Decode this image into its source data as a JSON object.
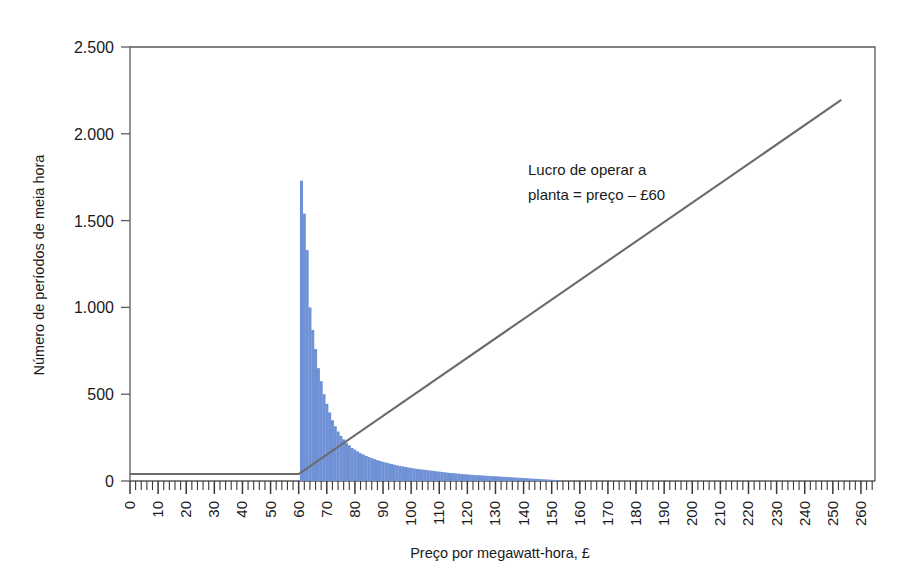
{
  "chart_data": {
    "type": "bar",
    "title": "",
    "subtitle": "",
    "xlabel": "Preço por megawatt-hora, £",
    "ylabel": "Número de períodos de meia hora",
    "xlim": [
      0,
      265
    ],
    "ylim": [
      0,
      2500
    ],
    "grid": false,
    "legend_position": "none",
    "y_ticks": [
      0,
      500,
      1000,
      1500,
      2000,
      2500
    ],
    "y_tick_labels": [
      "0",
      "500",
      "1.000",
      "1.500",
      "2.000",
      "2.500"
    ],
    "x_ticks": [
      0,
      10,
      20,
      30,
      40,
      50,
      60,
      70,
      80,
      90,
      100,
      110,
      120,
      130,
      140,
      150,
      160,
      170,
      180,
      190,
      200,
      210,
      220,
      230,
      240,
      250,
      260
    ],
    "x_tick_labels": [
      "0",
      "10",
      "20",
      "30",
      "40",
      "50",
      "60",
      "70",
      "80",
      "90",
      "100",
      "110",
      "120",
      "130",
      "140",
      "150",
      "160",
      "170",
      "180",
      "190",
      "200",
      "210",
      "220",
      "230",
      "240",
      "250",
      "260"
    ],
    "x_minor_tick_step": 2,
    "bar_color": "#6f91d6",
    "bar_width_units": 1.1,
    "series": [
      {
        "name": "Número de períodos de meia hora",
        "type": "bar",
        "color": "#6f91d6",
        "x": [
          61,
          62,
          63,
          64,
          65,
          66,
          67,
          68,
          69,
          70,
          71,
          72,
          73,
          74,
          75,
          76,
          77,
          78,
          79,
          80,
          81,
          82,
          83,
          84,
          85,
          86,
          87,
          88,
          89,
          90,
          91,
          92,
          93,
          94,
          95,
          96,
          97,
          98,
          99,
          100,
          101,
          102,
          103,
          104,
          105,
          106,
          107,
          108,
          109,
          110,
          111,
          112,
          113,
          114,
          115,
          116,
          117,
          118,
          119,
          120,
          121,
          122,
          123,
          124,
          125,
          126,
          127,
          128,
          129,
          130,
          131,
          132,
          133,
          134,
          135,
          136,
          137,
          138,
          139,
          140,
          141,
          142,
          143,
          144,
          145,
          146,
          147,
          148,
          149,
          150,
          151,
          152
        ],
        "values": [
          1730,
          1540,
          1330,
          1000,
          870,
          760,
          650,
          575,
          500,
          445,
          395,
          350,
          315,
          285,
          260,
          240,
          220,
          205,
          190,
          180,
          170,
          160,
          152,
          145,
          138,
          132,
          126,
          120,
          115,
          110,
          106,
          102,
          98,
          94,
          90,
          87,
          84,
          81,
          78,
          75,
          72,
          70,
          68,
          66,
          64,
          62,
          60,
          58,
          56,
          54,
          52,
          50,
          48,
          46,
          45,
          43,
          42,
          40,
          39,
          38,
          36,
          35,
          34,
          33,
          32,
          31,
          30,
          29,
          28,
          27,
          26,
          25,
          24,
          23,
          22,
          21,
          20,
          19,
          18,
          17,
          16,
          15,
          14,
          13,
          12,
          11,
          10,
          9,
          8,
          7,
          6,
          5
        ]
      },
      {
        "name": "Lucro de operar a planta",
        "type": "line",
        "color": "#6b6b6b",
        "x": [
          0,
          60,
          253
        ],
        "values": [
          40,
          40,
          2195
        ]
      }
    ],
    "annotations": [
      {
        "name": "profit-line-label",
        "lines": [
          "Lucro de operar a",
          "planta = preço – £60"
        ],
        "x_px": 528,
        "y_px": 175
      }
    ]
  },
  "axes": {
    "y_axis_title": "Número de períodos de meia hora",
    "x_axis_title": "Preço por megawatt-hora, £"
  },
  "annotation": {
    "line1": "Lucro de operar a",
    "line2": "planta = preço – £60"
  },
  "colors": {
    "bar": "#6f91d6",
    "profit_line": "#6b6b6b",
    "frame": "#5a5a5a",
    "text": "#1a1a1a",
    "background": "#ffffff"
  }
}
